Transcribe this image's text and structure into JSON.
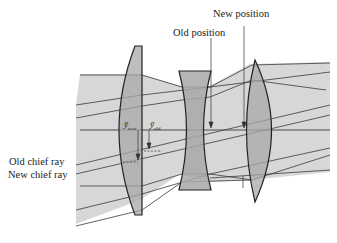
{
  "labels": {
    "new_position": "New position",
    "old_position": "Old position",
    "old_chief_ray": "Old chief ray",
    "new_chief_ray": "New chief ray",
    "y_new_symbol": "ȳ",
    "y_new_sub": "new",
    "y_old_symbol": "ȳ",
    "y_old_sub": "old"
  },
  "colors": {
    "beam_fill": "#d4d4d4",
    "lens_fill": "#a9a9a9",
    "stroke": "#2a2a2a",
    "background": "#ffffff"
  }
}
